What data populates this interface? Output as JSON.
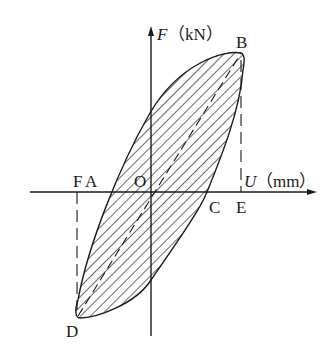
{
  "diagram": {
    "type": "hysteresis-loop",
    "axes": {
      "y_label_var": "F",
      "y_label_unit": "（kN）",
      "x_label_var": "U",
      "x_label_unit": "（mm）",
      "origin_label": "O"
    },
    "points": {
      "A": "A",
      "B": "B",
      "C": "C",
      "D": "D",
      "E": "E",
      "F": "F"
    },
    "colors": {
      "line": "#1a1a1a",
      "background": "#ffffff"
    },
    "fill_pattern": "diagonal-hatch"
  }
}
